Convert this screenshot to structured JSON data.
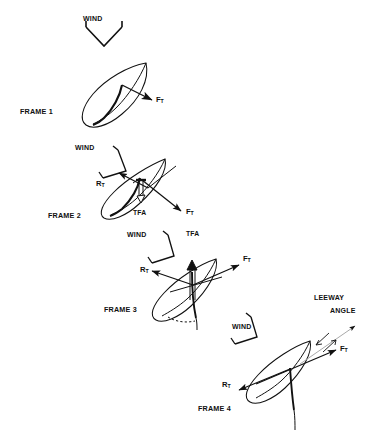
{
  "figure": {
    "type": "technical-line-diagram",
    "background_color": "#ffffff",
    "ink_color": "#111111",
    "width": 386,
    "height": 444
  },
  "frames": [
    {
      "id": "frame-1",
      "label": "FRAME 1",
      "wind": {
        "label": "WIND",
        "direction": "down",
        "arrow_style": "broad-chevron"
      },
      "vectors": [
        {
          "name": "F_T",
          "base": "F",
          "sub": "T",
          "label": "F",
          "subscript": "T",
          "direction": "down-right"
        }
      ]
    },
    {
      "id": "frame-2",
      "label": "FRAME 2",
      "wind": {
        "label": "WIND",
        "direction": "down-left",
        "arrow_style": "narrow-chevron"
      },
      "vectors": [
        {
          "name": "R_T",
          "base": "R",
          "sub": "T",
          "label": "R",
          "subscript": "T",
          "direction": "up-left"
        },
        {
          "name": "F_T",
          "base": "F",
          "sub": "T",
          "label": "F",
          "subscript": "T",
          "direction": "down-right"
        },
        {
          "name": "TFA",
          "base": "TFA",
          "sub": "",
          "label": "TFA",
          "subscript": "",
          "direction": "down"
        }
      ]
    },
    {
      "id": "frame-3",
      "label": "FRAME 3",
      "wind": {
        "label": "WIND",
        "direction": "down-left",
        "arrow_style": "narrow-chevron"
      },
      "vectors": [
        {
          "name": "R_T",
          "base": "R",
          "sub": "T",
          "label": "R",
          "subscript": "T",
          "direction": "up-left"
        },
        {
          "name": "F_T",
          "base": "F",
          "sub": "T",
          "label": "F",
          "subscript": "T",
          "direction": "up-right"
        },
        {
          "name": "TFA",
          "base": "TFA",
          "sub": "",
          "label": "TFA",
          "subscript": "",
          "direction": "up"
        }
      ]
    },
    {
      "id": "frame-4",
      "label": "FRAME 4",
      "wind": {
        "label": "WIND",
        "direction": "down-left",
        "arrow_style": "narrow-chevron"
      },
      "vectors": [
        {
          "name": "R_T",
          "base": "R",
          "sub": "T",
          "label": "R",
          "subscript": "T",
          "direction": "down-left"
        },
        {
          "name": "F_T",
          "base": "F",
          "sub": "T",
          "label": "F",
          "subscript": "T",
          "direction": "up-right"
        }
      ],
      "annotation": {
        "line1": "LEEWAY",
        "line2": "ANGLE",
        "name": "leeway-angle"
      }
    }
  ],
  "labels": {
    "frame1": "FRAME 1",
    "frame2": "FRAME 2",
    "frame3": "FRAME 3",
    "frame4": "FRAME 4",
    "wind": "WIND",
    "tfa": "TFA",
    "leeway_line1": "LEEWAY",
    "leeway_line2": "ANGLE",
    "f_base": "F",
    "f_sub": "T",
    "r_base": "R",
    "r_sub": "T"
  }
}
